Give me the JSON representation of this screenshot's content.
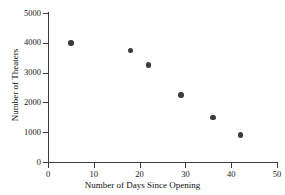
{
  "chart_data": {
    "type": "scatter",
    "title": "",
    "xlabel": "Number of Days Since Opening",
    "ylabel": "Number of Theaters",
    "xlim": [
      0,
      50
    ],
    "ylim": [
      0,
      5000
    ],
    "xticks": [
      0,
      10,
      20,
      30,
      40,
      50
    ],
    "yticks": [
      0,
      1000,
      2000,
      3000,
      4000,
      5000
    ],
    "xtick_labels": [
      "0",
      "10",
      "20",
      "30",
      "40",
      "50"
    ],
    "ytick_labels": [
      "0",
      "1000",
      "2000",
      "3000",
      "4000",
      "5000"
    ],
    "grid": false,
    "legend": null,
    "marker_color": "#3c3c3c",
    "axis_color": "#3a3a3a",
    "background_color": "#ffffff",
    "points": [
      {
        "x": 5,
        "y": 4000
      },
      {
        "x": 18,
        "y": 3750
      },
      {
        "x": 22,
        "y": 3250
      },
      {
        "x": 29,
        "y": 2250
      },
      {
        "x": 36,
        "y": 1500
      },
      {
        "x": 42,
        "y": 900
      }
    ]
  }
}
